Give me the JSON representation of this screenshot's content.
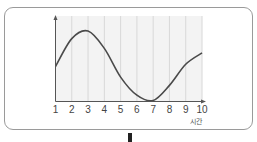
{
  "chart_data": {
    "type": "line",
    "title": "",
    "xlabel": "시간",
    "ylabel": "",
    "x": [
      1,
      2,
      3,
      4,
      5,
      6,
      7,
      8,
      9,
      10
    ],
    "x_tick_labels": [
      "1",
      "2",
      "3",
      "4",
      "5",
      "6",
      "7",
      "8",
      "9",
      "10"
    ],
    "series": [
      {
        "name": "curve",
        "values": [
          0.45,
          0.82,
          0.92,
          0.69,
          0.31,
          0.07,
          0.0,
          0.2,
          0.48,
          0.63
        ]
      }
    ],
    "y_ticks_shown": false,
    "grid": "vertical",
    "xlim": [
      1,
      10
    ],
    "colors": {
      "line": "#4a4a4a",
      "grid": "#d8d8d8",
      "plot_bg": "#f3f3f3",
      "axis": "#555555"
    }
  }
}
